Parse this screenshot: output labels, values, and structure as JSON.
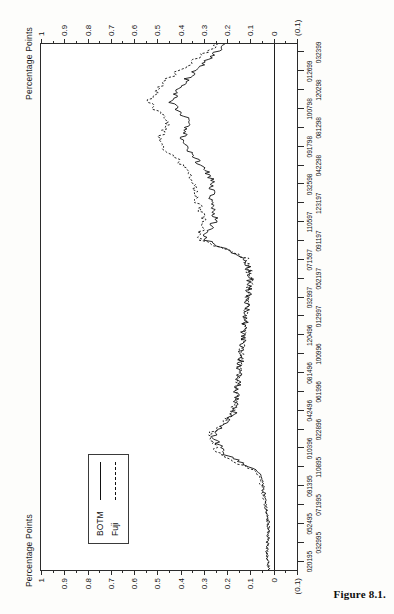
{
  "figure": {
    "caption": "Figure 8.1.",
    "rotation_note": "chart printed sideways on page"
  },
  "axes": {
    "y_title_left": "Percentage Points",
    "y_title_right": "Percentage Points",
    "y_ticks": [
      "1",
      "0.9",
      "0.8",
      "0.7",
      "0.6",
      "0.5",
      "0.4",
      "0.3",
      "0.2",
      "0.1",
      "0",
      "(0.1)"
    ],
    "y_values": [
      1,
      0.9,
      0.8,
      0.7,
      0.6,
      0.5,
      0.4,
      0.3,
      0.2,
      0.1,
      0,
      -0.1
    ],
    "y_min": -0.1,
    "y_max": 1.0
  },
  "legend": {
    "position": "upper-left-inside",
    "entries": [
      {
        "label": "BOTM",
        "style": "solid"
      },
      {
        "label": "Fuji",
        "style": "dashed"
      }
    ]
  },
  "chart_data": {
    "type": "line",
    "title": "",
    "subtitle": "",
    "xlabel": "",
    "ylabel": "Percentage Points",
    "ylim": [
      -0.1,
      1.0
    ],
    "grid": false,
    "legend_position": "upper left",
    "annotations": [],
    "tick_labels_row1": [
      "020195",
      "052495",
      "091395",
      "010396",
      "042496",
      "081496",
      "120496",
      "032997",
      "071597",
      "110597",
      "032598",
      "091798",
      "100798",
      "012699"
    ],
    "tick_labels_row2": [
      "032995",
      "071995",
      "110895",
      "022896",
      "061996",
      "100996",
      "012997",
      "052197",
      "091197",
      "123197",
      "042298",
      "081298",
      "120298",
      "032399"
    ],
    "categories": [
      "020195",
      "032995",
      "052495",
      "071995",
      "091395",
      "110895",
      "010396",
      "022896",
      "042496",
      "061996",
      "081496",
      "100996",
      "120496",
      "012997",
      "032997",
      "052197",
      "071597",
      "091197",
      "110597",
      "123197",
      "032598",
      "042298",
      "091798",
      "081298",
      "100798",
      "120298",
      "012699",
      "032399"
    ],
    "series": [
      {
        "name": "BOTM",
        "style": "solid",
        "values": [
          0.02,
          0.03,
          0.02,
          0.03,
          0.04,
          0.06,
          0.22,
          0.26,
          0.17,
          0.16,
          0.15,
          0.14,
          0.13,
          0.12,
          0.11,
          0.1,
          0.12,
          0.3,
          0.25,
          0.27,
          0.26,
          0.33,
          0.4,
          0.36,
          0.44,
          0.39,
          0.3,
          0.21
        ]
      },
      {
        "name": "Fuji",
        "style": "dashed",
        "values": [
          0.02,
          0.03,
          0.02,
          0.03,
          0.05,
          0.07,
          0.24,
          0.27,
          0.18,
          0.16,
          0.15,
          0.14,
          0.13,
          0.12,
          0.11,
          0.1,
          0.12,
          0.32,
          0.3,
          0.33,
          0.35,
          0.41,
          0.5,
          0.45,
          0.54,
          0.48,
          0.36,
          0.24
        ]
      }
    ]
  }
}
